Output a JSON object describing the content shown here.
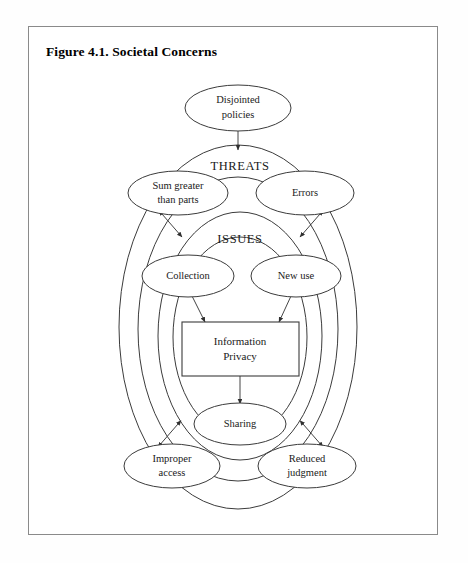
{
  "figure": {
    "title": "Figure 4.1. Societal Concerns",
    "frame_border_color": "#8a8a8a",
    "line_color": "#3b3b3b",
    "background_color": "#ffffff"
  },
  "rings": {
    "outer_label": "THREATS",
    "inner_label": "ISSUES"
  },
  "center": {
    "line1": "Information",
    "line2": "Privacy"
  },
  "nodes": {
    "disjointed": {
      "line1": "Disjointed",
      "line2": "policies"
    },
    "sum_greater": {
      "line1": "Sum greater",
      "line2": "than parts"
    },
    "errors": {
      "line1": "Errors",
      "line2": ""
    },
    "collection": {
      "line1": "Collection",
      "line2": ""
    },
    "new_use": {
      "line1": "New use",
      "line2": ""
    },
    "sharing": {
      "line1": "Sharing",
      "line2": ""
    },
    "improper_access": {
      "line1": "Improper",
      "line2": "access"
    },
    "reduced_judgment": {
      "line1": "Reduced",
      "line2": "judgment"
    }
  }
}
